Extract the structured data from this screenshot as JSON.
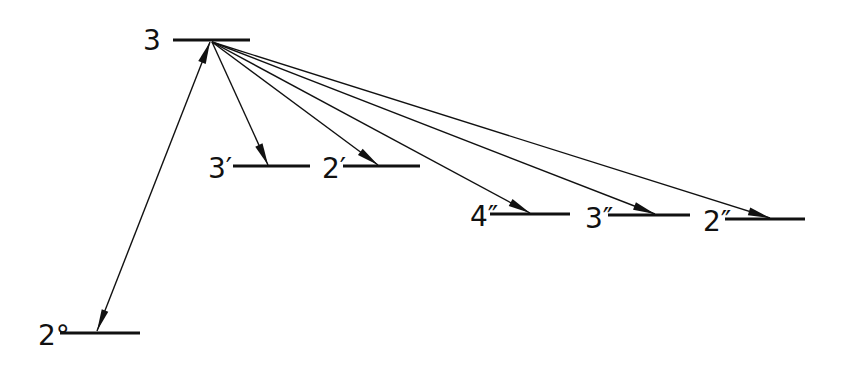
{
  "diagram": {
    "type": "energy-level transition diagram",
    "levels": [
      {
        "id": "3",
        "label": "3",
        "x1": 173,
        "x2": 250,
        "y": 40,
        "label_x": 143,
        "label_y": 50
      },
      {
        "id": "3p",
        "label": "3′",
        "x1": 233,
        "x2": 310,
        "y": 166,
        "label_x": 208,
        "label_y": 178
      },
      {
        "id": "2p",
        "label": "2′",
        "x1": 343,
        "x2": 420,
        "y": 166,
        "label_x": 322,
        "label_y": 178
      },
      {
        "id": "4pp",
        "label": "4″",
        "x1": 490,
        "x2": 570,
        "y": 214,
        "label_x": 470,
        "label_y": 226
      },
      {
        "id": "3pp",
        "label": "3″",
        "x1": 608,
        "x2": 690,
        "y": 215,
        "label_x": 585,
        "label_y": 228
      },
      {
        "id": "2pp",
        "label": "2″",
        "x1": 725,
        "x2": 805,
        "y": 219,
        "label_x": 703,
        "label_y": 231
      },
      {
        "id": "2o",
        "label": "2°",
        "x1": 60,
        "x2": 140,
        "y": 333,
        "label_x": 38,
        "label_y": 345
      }
    ],
    "transitions": [
      {
        "from": "2o",
        "to": "3",
        "x1": 97,
        "y1": 331,
        "x2": 210,
        "y2": 42,
        "bidirectional": true
      },
      {
        "from": "3",
        "to": "3p",
        "x1": 212,
        "y1": 42,
        "x2": 268,
        "y2": 165
      },
      {
        "from": "3",
        "to": "2p",
        "x1": 212,
        "y1": 42,
        "x2": 378,
        "y2": 165
      },
      {
        "from": "3",
        "to": "4pp",
        "x1": 212,
        "y1": 42,
        "x2": 530,
        "y2": 213
      },
      {
        "from": "3",
        "to": "3pp",
        "x1": 212,
        "y1": 42,
        "x2": 655,
        "y2": 214
      },
      {
        "from": "3",
        "to": "2pp",
        "x1": 212,
        "y1": 42,
        "x2": 770,
        "y2": 218
      }
    ]
  }
}
